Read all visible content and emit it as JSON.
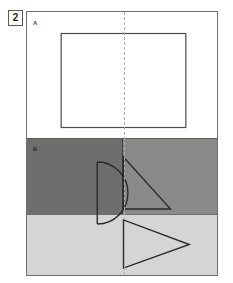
{
  "figure": {
    "number": "2",
    "panels": [
      {
        "id": "panel-a",
        "label": "A",
        "background": "#ffffff",
        "description": "unfolded white sheet with a plain rectangle straddling the dashed fold line",
        "shape": "rectangle"
      },
      {
        "id": "panel-b",
        "label": "B",
        "background_left": "#6e6e6c",
        "background_right": "#8a8a88",
        "description": "two shaded halves: a half-disc on the left of the fold, a right triangle on the right of the fold",
        "shape_left": "half-disc",
        "shape_right": "right-triangle"
      },
      {
        "id": "panel-c",
        "label": "",
        "background": "#d5d5d3",
        "description": "light grey band with a rightward pointing triangle whose vertical edge sits on the fold line",
        "shape": "rightward-triangle"
      }
    ],
    "fold_line": {
      "style": "dashed",
      "orientation": "vertical",
      "color": "#b8b0a8"
    },
    "colors": {
      "frame": "#6f6f6f",
      "stroke": "#2a2a2a",
      "panel_a_bg": "#ffffff",
      "panel_b_left_bg": "#6e6e6c",
      "panel_b_right_bg": "#8a8a88",
      "panel_c_bg": "#d5d5d3",
      "fold": "#b8b0a8"
    }
  }
}
